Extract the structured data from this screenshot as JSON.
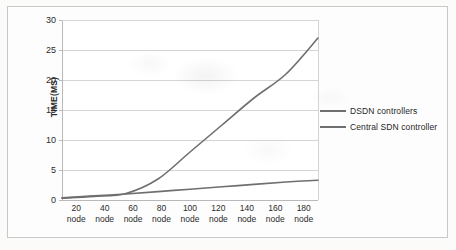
{
  "chart_data": {
    "type": "line",
    "title": "",
    "xlabel": "",
    "ylabel": "TIME(MS)",
    "categories": [
      "20 node",
      "40 node",
      "60 node",
      "80 node",
      "100 node",
      "120 node",
      "140 node",
      "160 node",
      "180 node"
    ],
    "x_tick_numbers": [
      "20",
      "40",
      "60",
      "80",
      "100",
      "120",
      "140",
      "160",
      "180"
    ],
    "x_tick_unit": "node",
    "ylim": [
      0,
      30
    ],
    "yticks": [
      0,
      5,
      10,
      15,
      20,
      25,
      30
    ],
    "ytick_labels": [
      "0",
      "5",
      "10",
      "15",
      "20",
      "25",
      "30"
    ],
    "grid": "horizontal",
    "legend_position": "right",
    "series": [
      {
        "name": "DSDN controllers",
        "color": "#6f6f6f",
        "values": [
          0.3,
          0.6,
          1.1,
          3.5,
          8.0,
          12.5,
          17.0,
          21.0,
          27.0
        ]
      },
      {
        "name": "Central SDN controller",
        "color": "#6f6f6f",
        "values": [
          0.35,
          0.7,
          1.0,
          1.4,
          1.8,
          2.2,
          2.6,
          3.0,
          3.3
        ]
      }
    ]
  },
  "legend": {
    "items": [
      {
        "label": "DSDN controllers"
      },
      {
        "label": "Central SDN controller"
      }
    ]
  },
  "colors": {
    "line": "#6f6f6f",
    "grid": "#d4d4d4",
    "axis": "#b9b9b9",
    "text": "#2b2b2b",
    "page": "#fbfbfa"
  }
}
